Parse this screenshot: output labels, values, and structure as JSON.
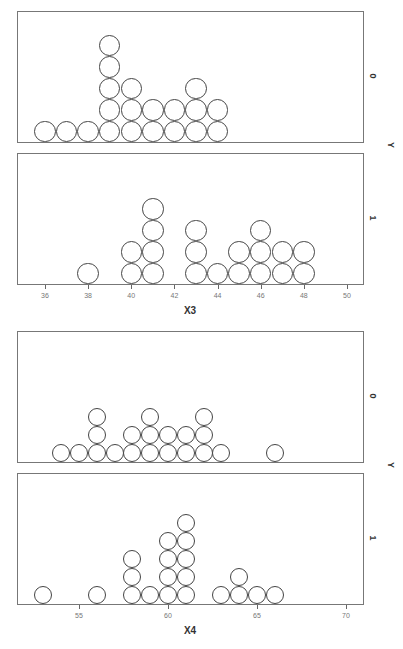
{
  "chart_data": [
    {
      "type": "dotplot",
      "xlabel": "X3",
      "ylabel": "Y",
      "x_ticks": [
        36,
        38,
        40,
        42,
        44,
        46,
        48,
        50
      ],
      "xlim": [
        35,
        51
      ],
      "panels": [
        {
          "group": "0",
          "counts": {
            "36": 1,
            "37": 1,
            "38": 1,
            "39": 5,
            "40": 3,
            "41": 2,
            "42": 2,
            "43": 3,
            "44": 2
          }
        },
        {
          "group": "1",
          "counts": {
            "38": 1,
            "40": 2,
            "41": 4,
            "43": 3,
            "44": 1,
            "45": 2,
            "46": 3,
            "47": 2,
            "48": 2
          }
        }
      ]
    },
    {
      "type": "dotplot",
      "xlabel": "X4",
      "ylabel": "Y",
      "x_ticks": [
        55,
        60,
        65,
        70
      ],
      "xlim": [
        51.5,
        71
      ],
      "panels": [
        {
          "group": "0",
          "counts": {
            "54": 1,
            "55": 1,
            "56": 3,
            "57": 1,
            "58": 2,
            "59": 3,
            "60": 2,
            "61": 2,
            "62": 3,
            "63": 1,
            "66": 1
          }
        },
        {
          "group": "1",
          "counts": {
            "53": 1,
            "56": 1,
            "58": 3,
            "59": 1,
            "60": 4,
            "61": 5,
            "63": 1,
            "64": 2,
            "65": 1,
            "66": 1
          }
        }
      ]
    }
  ]
}
